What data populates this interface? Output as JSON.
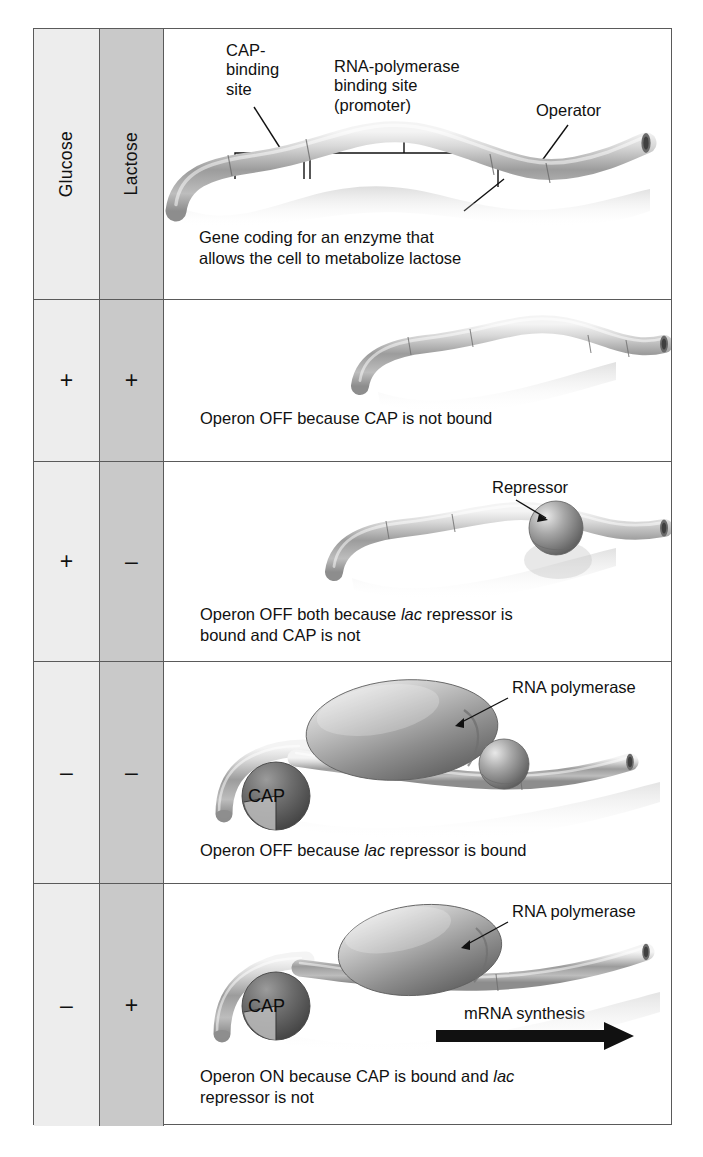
{
  "figure": {
    "columns": [
      {
        "key": "glucose",
        "label": "Glucose"
      },
      {
        "key": "lactose",
        "label": "Lactose"
      }
    ],
    "rows": [
      {
        "id": "reference",
        "glucose": "",
        "lactose": "",
        "labels": {
          "cap_site": "CAP-\nbinding\nsite",
          "cap_site_l1": "CAP-",
          "cap_site_l2": "binding",
          "cap_site_l3": "site",
          "promoter_l1": "RNA-polymerase",
          "promoter_l2": "binding site",
          "promoter_l3": "(promoter)",
          "operator": "Operator",
          "gene_l1": "Gene coding for an enzyme that",
          "gene_l2": "allows the cell to metabolize lactose"
        }
      },
      {
        "id": "glucose-plus-lactose-plus",
        "glucose": "+",
        "lactose": "+",
        "caption_l1": "Operon OFF because CAP is not bound",
        "caption_l2": "",
        "proteins": []
      },
      {
        "id": "glucose-plus-lactose-minus",
        "glucose": "+",
        "lactose": "–",
        "caption_l1": "Operon OFF both because lac repressor is",
        "caption_l2": "bound and CAP is not",
        "caption_italic": "lac",
        "labels": {
          "repressor": "Repressor"
        },
        "proteins": [
          "repressor"
        ]
      },
      {
        "id": "glucose-minus-lactose-minus",
        "glucose": "–",
        "lactose": "–",
        "caption_l1": "Operon OFF because lac repressor is bound",
        "caption_l2": "",
        "caption_italic": "lac",
        "labels": {
          "rna_polymerase": "RNA polymerase",
          "cap": "CAP"
        },
        "proteins": [
          "cap",
          "rna-polymerase",
          "repressor"
        ]
      },
      {
        "id": "glucose-minus-lactose-plus",
        "glucose": "–",
        "lactose": "+",
        "caption_l1": "Operon ON because CAP is bound and lac",
        "caption_l2": "repressor is not",
        "caption_italic": "lac",
        "labels": {
          "rna_polymerase": "RNA polymerase",
          "cap": "CAP",
          "mrna": "mRNA synthesis"
        },
        "proteins": [
          "cap",
          "rna-polymerase"
        ]
      }
    ],
    "colors": {
      "glucose_column_bg": "#ededed",
      "lactose_column_bg": "#c9c9c9",
      "border": "#5a5a5a",
      "dna_light": "#e2e2e2",
      "dna_mid": "#9a9a9a",
      "dna_dark": "#6e6e6e",
      "protein_light": "#d8d8d8",
      "protein_dark": "#5f5f5f",
      "cap_dark": "#555555",
      "arrow": "#111111",
      "text": "#111111"
    }
  }
}
